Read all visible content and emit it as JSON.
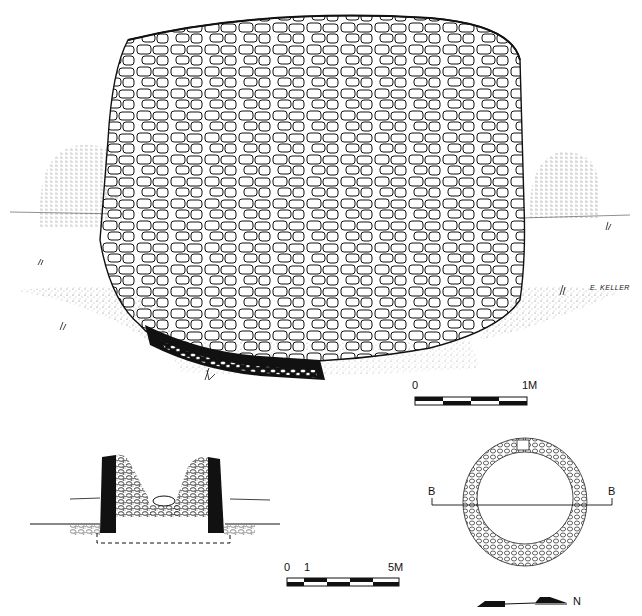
{
  "figure": {
    "type": "archaeological line drawing",
    "signature": "E. KELLER"
  },
  "elevation_scale": {
    "start_label": "0",
    "end_label": "1M",
    "segments": 4
  },
  "section_scale": {
    "start_label": "0",
    "mid_label": "1",
    "end_label": "5M",
    "segments": 5
  },
  "plan": {
    "section_label_left": "B",
    "section_label_right": "B"
  },
  "north_arrow": {
    "label": "N"
  },
  "colors": {
    "ink": "#111111",
    "paper": "#ffffff",
    "stipple": "#777777"
  }
}
